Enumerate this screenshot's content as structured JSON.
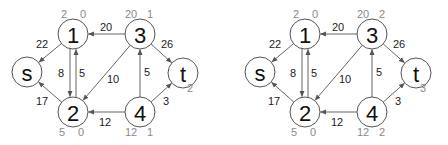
{
  "graphs": [
    {
      "id": "left",
      "offset_x": 0,
      "nodes": [
        {
          "id": "s",
          "label": "s",
          "x": 27,
          "y": 72,
          "meta": []
        },
        {
          "id": "1",
          "label": "1",
          "x": 73,
          "y": 34,
          "meta": [
            {
              "text": "2",
              "dx": -9,
              "dy": -20
            },
            {
              "text": "0",
              "dx": 10,
              "dy": -20
            }
          ]
        },
        {
          "id": "3",
          "label": "3",
          "x": 140,
          "y": 34,
          "meta": [
            {
              "text": "20",
              "dx": -9,
              "dy": -20
            },
            {
              "text": "1",
              "dx": 10,
              "dy": -20
            }
          ]
        },
        {
          "id": "t",
          "label": "t",
          "x": 183,
          "y": 73,
          "meta": [
            {
              "text": "2",
              "dx": 7,
              "dy": 15
            }
          ]
        },
        {
          "id": "2",
          "label": "2",
          "x": 73,
          "y": 112,
          "meta": [
            {
              "text": "5",
              "dx": -11,
              "dy": 20
            },
            {
              "text": "0",
              "dx": 8,
              "dy": 20
            }
          ]
        },
        {
          "id": "4",
          "label": "4",
          "x": 140,
          "y": 112,
          "meta": [
            {
              "text": "12",
              "dx": -9,
              "dy": 20
            },
            {
              "text": "1",
              "dx": 10,
              "dy": 20
            }
          ]
        }
      ],
      "edges": [
        {
          "from": "1",
          "to": "s",
          "weight": "22",
          "lx": 42,
          "ly": 44
        },
        {
          "from": "1",
          "to": "2",
          "weight": "8",
          "lx": 61,
          "ly": 73,
          "offset": -3
        },
        {
          "from": "2",
          "to": "1",
          "weight": "5",
          "lx": 82,
          "ly": 73,
          "offset": 3
        },
        {
          "from": "3",
          "to": "1",
          "weight": "20",
          "lx": 106,
          "ly": 27
        },
        {
          "from": "3",
          "to": "2",
          "weight": "10",
          "lx": 113,
          "ly": 79
        },
        {
          "from": "3",
          "to": "t",
          "weight": "26",
          "lx": 167,
          "ly": 44
        },
        {
          "from": "4",
          "to": "3",
          "weight": "5",
          "lx": 147,
          "ly": 72
        },
        {
          "from": "4",
          "to": "2",
          "weight": "12",
          "lx": 105,
          "ly": 122
        },
        {
          "from": "4",
          "to": "t",
          "weight": "3",
          "lx": 166,
          "ly": 101
        },
        {
          "from": "2",
          "to": "s",
          "weight": "17",
          "lx": 42,
          "ly": 101
        }
      ]
    },
    {
      "id": "right",
      "offset_x": 0,
      "nodes": [
        {
          "id": "s",
          "label": "s",
          "x": 260,
          "y": 72,
          "meta": []
        },
        {
          "id": "1",
          "label": "1",
          "x": 305,
          "y": 34,
          "meta": [
            {
              "text": "2",
              "dx": -9,
              "dy": -20
            },
            {
              "text": "0",
              "dx": 10,
              "dy": -20
            }
          ]
        },
        {
          "id": "3",
          "label": "3",
          "x": 372,
          "y": 34,
          "meta": [
            {
              "text": "20",
              "dx": -9,
              "dy": -20
            },
            {
              "text": "2",
              "dx": 10,
              "dy": -20
            }
          ]
        },
        {
          "id": "t",
          "label": "t",
          "x": 416,
          "y": 73,
          "meta": [
            {
              "text": "3",
              "dx": 7,
              "dy": 15
            }
          ]
        },
        {
          "id": "2",
          "label": "2",
          "x": 305,
          "y": 112,
          "meta": [
            {
              "text": "5",
              "dx": -11,
              "dy": 20
            },
            {
              "text": "0",
              "dx": 8,
              "dy": 20
            }
          ]
        },
        {
          "id": "4",
          "label": "4",
          "x": 372,
          "y": 112,
          "meta": [
            {
              "text": "12",
              "dx": -9,
              "dy": 20
            },
            {
              "text": "2",
              "dx": 10,
              "dy": 20
            }
          ]
        }
      ],
      "edges": [
        {
          "from": "1",
          "to": "s",
          "weight": "22",
          "lx": 275,
          "ly": 44
        },
        {
          "from": "1",
          "to": "2",
          "weight": "8",
          "lx": 293,
          "ly": 73,
          "offset": -3
        },
        {
          "from": "2",
          "to": "1",
          "weight": "5",
          "lx": 314,
          "ly": 73,
          "offset": 3
        },
        {
          "from": "3",
          "to": "1",
          "weight": "20",
          "lx": 338,
          "ly": 27
        },
        {
          "from": "3",
          "to": "2",
          "weight": "10",
          "lx": 345,
          "ly": 79
        },
        {
          "from": "3",
          "to": "t",
          "weight": "26",
          "lx": 399,
          "ly": 44
        },
        {
          "from": "4",
          "to": "3",
          "weight": "5",
          "lx": 379,
          "ly": 72
        },
        {
          "from": "4",
          "to": "2",
          "weight": "12",
          "lx": 337,
          "ly": 122
        },
        {
          "from": "4",
          "to": "t",
          "weight": "3",
          "lx": 398,
          "ly": 101
        },
        {
          "from": "2",
          "to": "s",
          "weight": "17",
          "lx": 274,
          "ly": 101
        }
      ]
    }
  ],
  "style": {
    "node_radius": 15,
    "stroke_color": "#555555",
    "meta_color": "#8a8a8a",
    "text_color": "#111111"
  }
}
